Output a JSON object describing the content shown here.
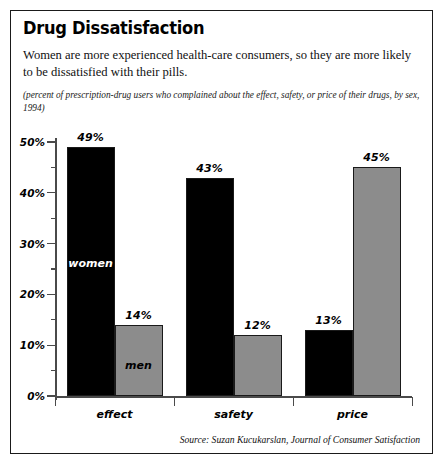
{
  "card": {
    "title": "Drug Dissatisfaction",
    "deck": "Women are more experienced health-care consumers, so they are more likely to be dissatisfied with their pills.",
    "note": "(percent of prescription-drug users who complained about the effect, safety, or price of their drugs, by sex, 1994)",
    "source": "Source: Suzan Kucukarslan, Journal of Consumer Satisfaction",
    "border_color": "#1a1a1a",
    "background": "#ffffff"
  },
  "chart_data": {
    "type": "bar",
    "title": "Drug Dissatisfaction",
    "subtitle": "(percent of prescription-drug users who complained about the effect, safety, or price of their drugs, by sex, 1994)",
    "categories": [
      "effect",
      "safety",
      "price"
    ],
    "series": [
      {
        "name": "women",
        "color": "#000000",
        "values": [
          49,
          43,
          13
        ]
      },
      {
        "name": "men",
        "color": "#8c8c8c",
        "values": [
          14,
          12,
          45
        ]
      }
    ],
    "value_labels": [
      "49%",
      "14%",
      "43%",
      "12%",
      "13%",
      "45%"
    ],
    "xlabel": "",
    "ylabel": "",
    "ylim": [
      0,
      50
    ],
    "ytick_values": [
      0,
      10,
      20,
      30,
      40,
      50
    ],
    "ytick_labels": [
      "0%",
      "10%",
      "20%",
      "30%",
      "40%",
      "50%"
    ],
    "yminor_values": [
      5,
      15,
      25,
      35,
      45
    ],
    "grid": false,
    "legend": "in-bar labels: women (first group, black bar), men (first group, gray bar)",
    "legend_position": "none",
    "annotations": [
      "women",
      "men"
    ],
    "units": "percent"
  }
}
